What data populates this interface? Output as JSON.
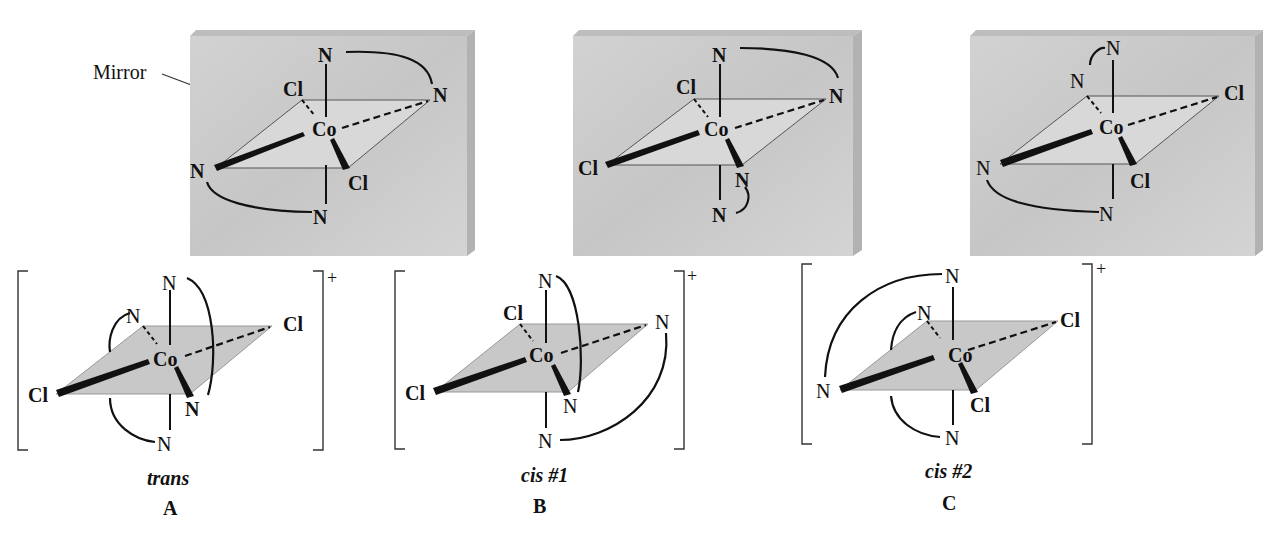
{
  "figure": {
    "mirror_label": "Mirror",
    "charge": "+",
    "colors": {
      "mirror_face": "#cfcfcf",
      "mirror_edge": "#b5b5b5",
      "plane_fill": "#cdcdcd",
      "ink": "#111111"
    },
    "atoms": {
      "center": "Co",
      "nitrogen": "N",
      "chlorine": "Cl"
    },
    "mirror_images": [
      {
        "id": "mirror-1",
        "ligands": [
          "N",
          "N",
          "Cl",
          "N",
          "Cl",
          "N"
        ]
      },
      {
        "id": "mirror-2",
        "ligands": [
          "N",
          "N",
          "Cl",
          "Cl",
          "N",
          "N"
        ]
      },
      {
        "id": "mirror-3",
        "ligands": [
          "N",
          "N",
          "Cl",
          "N",
          "Cl",
          "N"
        ]
      }
    ],
    "isomers": [
      {
        "name": "trans",
        "letter": "A"
      },
      {
        "name": "cis #1",
        "letter": "B"
      },
      {
        "name": "cis #2",
        "letter": "C"
      }
    ]
  }
}
